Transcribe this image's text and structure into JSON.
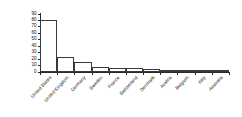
{
  "chart_data": {
    "type": "bar",
    "title": "",
    "xlabel": "",
    "ylabel": "Number of Winners",
    "ylim": [
      0,
      90
    ],
    "ytick_step": 10,
    "yticks": [
      0,
      10,
      20,
      30,
      40,
      50,
      60,
      70,
      80,
      90
    ],
    "grid": false,
    "legend": false,
    "categories": [
      "United States",
      "United Kingdom",
      "Germany",
      "Sweden",
      "France",
      "Switzerland",
      "Denmark",
      "Austria",
      "Belgium",
      "Italy",
      "Australia"
    ],
    "values": [
      80,
      24,
      16,
      8,
      7,
      7,
      5,
      3,
      2,
      2,
      1
    ],
    "bar_facecolor": "#ffffff",
    "bar_edgecolor": "#3a3a3a",
    "axis_color": "#2b2b2b",
    "text_color": "#111111",
    "background": "#ffffff"
  }
}
